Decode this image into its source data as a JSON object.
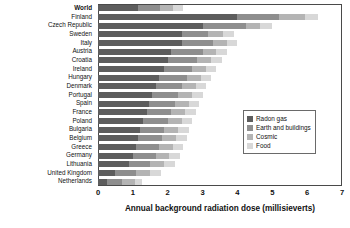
{
  "chart_data": {
    "type": "bar",
    "orientation": "horizontal",
    "stacked": true,
    "title": "",
    "xlabel": "Annual background radiation dose (millisieverts)",
    "ylabel": "",
    "xlim": [
      0,
      7
    ],
    "xticks": [
      0,
      1,
      2,
      3,
      4,
      5,
      6,
      7
    ],
    "grid": false,
    "legend_position": "right-inside",
    "legend": [
      "Radon gas",
      "Earth and buildings",
      "Cosmic",
      "Food"
    ],
    "series": [
      {
        "name": "Radon gas",
        "color": "#5d5d5d",
        "values": [
          1.15,
          4.0,
          3.0,
          2.4,
          2.4,
          2.1,
          2.0,
          1.9,
          1.75,
          1.65,
          1.55,
          1.45,
          1.4,
          1.3,
          1.2,
          1.15,
          1.1,
          1.0,
          0.9,
          0.5,
          0.25
        ]
      },
      {
        "name": "Earth and buildings",
        "color": "#8e8e8e",
        "values": [
          0.62,
          1.2,
          1.25,
          0.75,
          0.9,
          0.9,
          0.85,
          0.8,
          0.8,
          0.75,
          0.75,
          0.75,
          0.7,
          0.7,
          0.7,
          0.7,
          0.65,
          0.65,
          0.6,
          0.6,
          0.45
        ]
      },
      {
        "name": "Cosmic",
        "color": "#b4b4b4",
        "values": [
          0.39,
          0.75,
          0.4,
          0.45,
          0.4,
          0.4,
          0.4,
          0.4,
          0.4,
          0.4,
          0.4,
          0.4,
          0.4,
          0.4,
          0.4,
          0.4,
          0.4,
          0.4,
          0.4,
          0.4,
          0.35
        ]
      },
      {
        "name": "Food",
        "color": "#d8d8d8",
        "values": [
          0.29,
          0.35,
          0.35,
          0.3,
          0.3,
          0.3,
          0.3,
          0.3,
          0.3,
          0.3,
          0.3,
          0.3,
          0.3,
          0.3,
          0.3,
          0.3,
          0.3,
          0.3,
          0.3,
          0.3,
          0.2
        ]
      }
    ],
    "categories": [
      "World",
      "Finland",
      "Czech Republic",
      "Sweden",
      "Italy",
      "Austria",
      "Croatia",
      "Ireland",
      "Hungary",
      "Denmark",
      "Portugal",
      "Spain",
      "France",
      "Poland",
      "Bulgaria",
      "Belgium",
      "Greece",
      "Germany",
      "Lithuania",
      "United Kingdom",
      "Netherlands"
    ],
    "totals": [
      2.45,
      6.3,
      5.0,
      3.9,
      4.0,
      3.7,
      3.55,
      3.4,
      3.25,
      3.1,
      3.0,
      2.9,
      2.8,
      2.7,
      2.6,
      2.55,
      2.45,
      2.35,
      2.2,
      1.8,
      1.25
    ],
    "emphasized_category": "World"
  }
}
